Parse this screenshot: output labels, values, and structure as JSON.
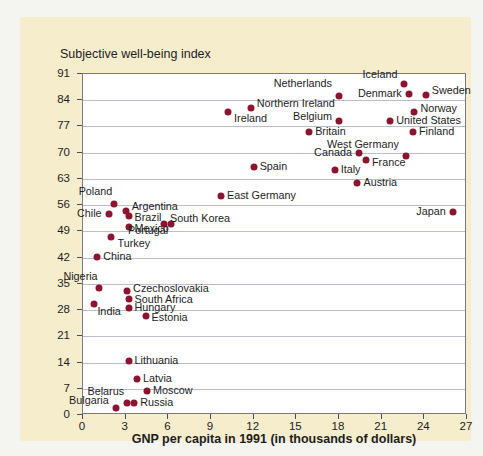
{
  "chart_data": {
    "type": "scatter",
    "title": "",
    "ylabel": "Subjective well-being index",
    "xlabel": "GNP per capita in 1991 (in thousands of dollars)",
    "xlim": [
      0,
      27
    ],
    "ylim": [
      0,
      91
    ],
    "xticks": [
      0,
      3,
      6,
      9,
      12,
      15,
      18,
      21,
      24,
      27
    ],
    "yticks": [
      0,
      7,
      14,
      21,
      28,
      35,
      42,
      49,
      56,
      63,
      70,
      77,
      84,
      91
    ],
    "grid": true,
    "legend": "none",
    "point_color": "#8c1430",
    "points": [
      {
        "label": "Iceland",
        "x": 22.6,
        "y": 88.3,
        "lx": -6,
        "ly": -9,
        "align": "left"
      },
      {
        "label": "Sweden",
        "x": 24.1,
        "y": 85.4,
        "lx": 7,
        "ly": -4,
        "align": "right"
      },
      {
        "label": "Denmark",
        "x": 22.9,
        "y": 85.7,
        "lx": -6,
        "ly": 0,
        "align": "left"
      },
      {
        "label": "Netherlands",
        "x": 18.0,
        "y": 85.1,
        "lx": -6,
        "ly": -12,
        "align": "left"
      },
      {
        "label": "Norway",
        "x": 23.3,
        "y": 80.8,
        "lx": 7,
        "ly": -3,
        "align": "right"
      },
      {
        "label": "United States",
        "x": 21.6,
        "y": 78.4,
        "lx": 7,
        "ly": 0,
        "align": "right"
      },
      {
        "label": "Belgium",
        "x": 18.0,
        "y": 78.4,
        "lx": -6,
        "ly": -4,
        "align": "left"
      },
      {
        "label": "Northern Ireland",
        "x": 11.8,
        "y": 81.9,
        "lx": 7,
        "ly": -4,
        "align": "right"
      },
      {
        "label": "Ireland",
        "x": 10.2,
        "y": 80.8,
        "lx": 7,
        "ly": 7,
        "align": "right"
      },
      {
        "label": "Finland",
        "x": 23.2,
        "y": 75.4,
        "lx": 7,
        "ly": 0,
        "align": "right"
      },
      {
        "label": "Britain",
        "x": 15.9,
        "y": 75.4,
        "lx": 7,
        "ly": 0,
        "align": "right"
      },
      {
        "label": "West Germany",
        "x": 22.7,
        "y": 69.0,
        "lx": -6,
        "ly": -11,
        "align": "left"
      },
      {
        "label": "France",
        "x": 19.9,
        "y": 68.0,
        "lx": 7,
        "ly": 3,
        "align": "right"
      },
      {
        "label": "Canada",
        "x": 19.4,
        "y": 69.8,
        "lx": -6,
        "ly": 0,
        "align": "left"
      },
      {
        "label": "Italy",
        "x": 17.7,
        "y": 65.5,
        "lx": 7,
        "ly": 0,
        "align": "right"
      },
      {
        "label": "Austria",
        "x": 19.3,
        "y": 61.8,
        "lx": 7,
        "ly": 0,
        "align": "right"
      },
      {
        "label": "Spain",
        "x": 12.0,
        "y": 66.1,
        "lx": 7,
        "ly": 0,
        "align": "right"
      },
      {
        "label": "East Germany",
        "x": 9.7,
        "y": 58.5,
        "lx": 7,
        "ly": 0,
        "align": "right"
      },
      {
        "label": "Japan",
        "x": 26.0,
        "y": 54.2,
        "lx": -6,
        "ly": 0,
        "align": "left"
      },
      {
        "label": "Poland",
        "x": 2.2,
        "y": 56.4,
        "lx": -1,
        "ly": -12,
        "align": "left"
      },
      {
        "label": "Argentina",
        "x": 3.0,
        "y": 54.5,
        "lx": 7,
        "ly": -4,
        "align": "right"
      },
      {
        "label": "Chile",
        "x": 1.8,
        "y": 53.7,
        "lx": -6,
        "ly": 0,
        "align": "left"
      },
      {
        "label": "Brazil",
        "x": 3.2,
        "y": 53.2,
        "lx": 7,
        "ly": 2,
        "align": "right"
      },
      {
        "label": "South Korea",
        "x": 5.7,
        "y": 51.0,
        "lx": 7,
        "ly": -5,
        "align": "right"
      },
      {
        "label": "Portugal",
        "x": 6.2,
        "y": 51.0,
        "lx": -2,
        "ly": 7,
        "align": "left"
      },
      {
        "label": "Mexico",
        "x": 3.2,
        "y": 50.2,
        "lx": 7,
        "ly": 2,
        "align": "right"
      },
      {
        "label": "Turkey",
        "x": 2.0,
        "y": 47.5,
        "lx": 7,
        "ly": 7,
        "align": "right"
      },
      {
        "label": "China",
        "x": 1.0,
        "y": 42.2,
        "lx": 7,
        "ly": 0,
        "align": "right"
      },
      {
        "label": "Nigeria",
        "x": 1.1,
        "y": 34.0,
        "lx": 0,
        "ly": -11,
        "align": "left"
      },
      {
        "label": "Czechoslovakia",
        "x": 3.1,
        "y": 33.2,
        "lx": 7,
        "ly": -2,
        "align": "right"
      },
      {
        "label": "South Africa",
        "x": 3.2,
        "y": 31.0,
        "lx": 7,
        "ly": 1,
        "align": "right"
      },
      {
        "label": "India",
        "x": 0.8,
        "y": 29.5,
        "lx": 4,
        "ly": 8,
        "align": "right"
      },
      {
        "label": "Hungary",
        "x": 3.2,
        "y": 28.5,
        "lx": 7,
        "ly": 0,
        "align": "right"
      },
      {
        "label": "Estonia",
        "x": 4.4,
        "y": 26.5,
        "lx": 7,
        "ly": 2,
        "align": "right"
      },
      {
        "label": "Lithuania",
        "x": 3.2,
        "y": 14.5,
        "lx": 7,
        "ly": 0,
        "align": "right"
      },
      {
        "label": "Latvia",
        "x": 3.8,
        "y": 9.5,
        "lx": 7,
        "ly": 0,
        "align": "right"
      },
      {
        "label": "Moscow",
        "x": 4.5,
        "y": 6.5,
        "lx": 7,
        "ly": 0,
        "align": "right"
      },
      {
        "label": "Belarus",
        "x": 3.1,
        "y": 3.2,
        "lx": -2,
        "ly": -11,
        "align": "left"
      },
      {
        "label": "Russia",
        "x": 3.6,
        "y": 3.2,
        "lx": 7,
        "ly": 0,
        "align": "right"
      },
      {
        "label": "Bulgaria",
        "x": 2.3,
        "y": 1.8,
        "lx": -6,
        "ly": -7,
        "align": "left"
      }
    ]
  }
}
